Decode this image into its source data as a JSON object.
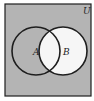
{
  "diagram": {
    "type": "venn",
    "universe_label": "U",
    "sets": [
      {
        "label": "A",
        "cx": 36,
        "cy": 51,
        "r": 24
      },
      {
        "label": "B",
        "cx": 63,
        "cy": 51,
        "r": 24
      }
    ],
    "frame": {
      "x": 5,
      "y": 4,
      "width": 86,
      "height": 92
    },
    "shaded_region": "complement of B (U minus B)",
    "colors": {
      "shade": "#b4b4b4",
      "unshaded": "#f6f6f6",
      "stroke": "#1e1e1e"
    }
  }
}
